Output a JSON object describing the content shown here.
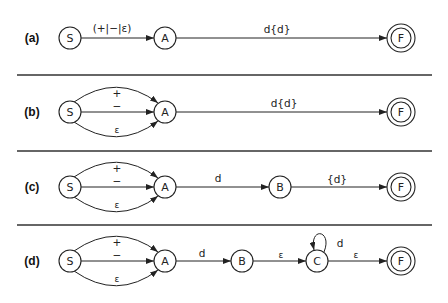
{
  "figure": {
    "rows": [
      {
        "label": "(a)",
        "nodes": [
          {
            "id": "S",
            "label": "S",
            "accepting": false
          },
          {
            "id": "A",
            "label": "A",
            "accepting": false
          },
          {
            "id": "F",
            "label": "F",
            "accepting": true
          }
        ],
        "edges": [
          {
            "from": "S",
            "to": "A",
            "label": "(+|−|ε)"
          },
          {
            "from": "A",
            "to": "F",
            "label": "d{d}"
          }
        ]
      },
      {
        "label": "(b)",
        "nodes": [
          {
            "id": "S",
            "label": "S",
            "accepting": false
          },
          {
            "id": "A",
            "label": "A",
            "accepting": false
          },
          {
            "id": "F",
            "label": "F",
            "accepting": true
          }
        ],
        "edges": [
          {
            "from": "S",
            "to": "A",
            "label": "+"
          },
          {
            "from": "S",
            "to": "A",
            "label": "−"
          },
          {
            "from": "S",
            "to": "A",
            "label": "ε"
          },
          {
            "from": "A",
            "to": "F",
            "label": "d{d}"
          }
        ]
      },
      {
        "label": "(c)",
        "nodes": [
          {
            "id": "S",
            "label": "S",
            "accepting": false
          },
          {
            "id": "A",
            "label": "A",
            "accepting": false
          },
          {
            "id": "B",
            "label": "B",
            "accepting": false
          },
          {
            "id": "F",
            "label": "F",
            "accepting": true
          }
        ],
        "edges": [
          {
            "from": "S",
            "to": "A",
            "label": "+"
          },
          {
            "from": "S",
            "to": "A",
            "label": "−"
          },
          {
            "from": "S",
            "to": "A",
            "label": "ε"
          },
          {
            "from": "A",
            "to": "B",
            "label": "d"
          },
          {
            "from": "B",
            "to": "F",
            "label": "{d}"
          }
        ]
      },
      {
        "label": "(d)",
        "nodes": [
          {
            "id": "S",
            "label": "S",
            "accepting": false
          },
          {
            "id": "A",
            "label": "A",
            "accepting": false
          },
          {
            "id": "B",
            "label": "B",
            "accepting": false
          },
          {
            "id": "C",
            "label": "C",
            "accepting": false
          },
          {
            "id": "F",
            "label": "F",
            "accepting": true
          }
        ],
        "edges": [
          {
            "from": "S",
            "to": "A",
            "label": "+"
          },
          {
            "from": "S",
            "to": "A",
            "label": "−"
          },
          {
            "from": "S",
            "to": "A",
            "label": "ε"
          },
          {
            "from": "A",
            "to": "B",
            "label": "d"
          },
          {
            "from": "B",
            "to": "C",
            "label": "ε"
          },
          {
            "from": "C",
            "to": "C",
            "label": "d"
          },
          {
            "from": "C",
            "to": "F",
            "label": "ε"
          }
        ]
      }
    ]
  }
}
